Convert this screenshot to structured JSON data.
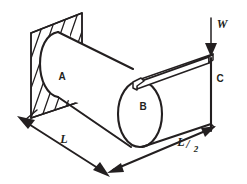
{
  "figure": {
    "kind": "engineering-diagram",
    "canvas": {
      "width": 247,
      "height": 184
    },
    "background_color": "#ffffff",
    "line_color": "#231f20"
  },
  "labels": {
    "member_a": "A",
    "member_b": "B",
    "member_c": "C",
    "load": "W",
    "dimension_left": "L",
    "dimension_right_numerator": "L",
    "dimension_right_slash": "/",
    "dimension_right_denominator": "2",
    "dimension_right_full": "L/2"
  },
  "parts": [
    {
      "name": "wall",
      "label": "",
      "description": "hatched fixed support plate"
    },
    {
      "name": "shaft-a",
      "label": "A",
      "description": "long horizontal cylinder fixed to wall"
    },
    {
      "name": "end-cap-b",
      "label": "B",
      "description": "elliptical free end of shaft"
    },
    {
      "name": "arm",
      "label": "",
      "description": "thin bar from B toward load point"
    },
    {
      "name": "post-c",
      "label": "C",
      "description": "vertical member under load point"
    },
    {
      "name": "load-arrow",
      "label": "W",
      "description": "downward point load"
    }
  ],
  "dimensions": [
    {
      "name": "length-l",
      "label": "L",
      "description": "length of shaft A along ground"
    },
    {
      "name": "length-l-half",
      "label": "L/2",
      "description": "length of arm along ground"
    }
  ]
}
